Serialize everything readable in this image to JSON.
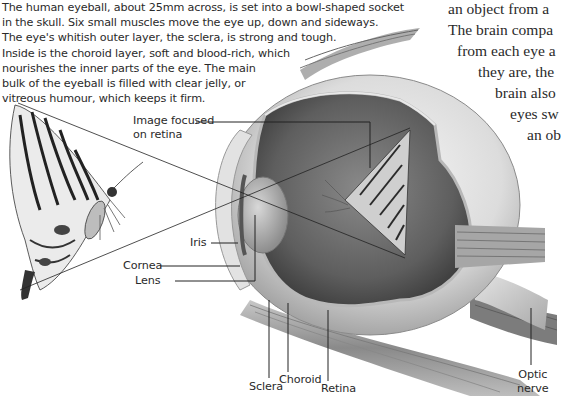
{
  "intro_text": {
    "lines": [
      "The human eyeball, about 25mm across, is set into a bowl-shaped socket",
      "in the skull. Six small muscles move the eye up, down and sideways.",
      "The eye's whitish outer layer, the sclera, is strong and tough.",
      "Inside is the choroid layer, soft and blood-rich, which",
      "nourishes the inner parts of the eye. The main",
      "bulk of the eyeball is filled with clear jelly, or",
      "vitreous humour, which keeps it firm."
    ]
  },
  "side_text": {
    "lines": [
      "an object from a",
      "The brain compa",
      "from each eye a",
      "they are, the",
      "brain also",
      "eyes sw",
      "an ob"
    ]
  },
  "labels": {
    "image_focused": [
      "Image focused",
      "on retina"
    ],
    "iris": "Iris",
    "cornea": "Cornea",
    "lens": "Lens",
    "sclera": "Sclera",
    "choroid": "Choroid",
    "retina": "Retina",
    "optic_nerve": [
      "Optic",
      "nerve"
    ]
  },
  "colors": {
    "text": "#2a2a2a",
    "leader_line": "#222222",
    "eye_white": "#e4e4e4",
    "eye_interior": "#6e6e6e",
    "background": "#ffffff"
  }
}
